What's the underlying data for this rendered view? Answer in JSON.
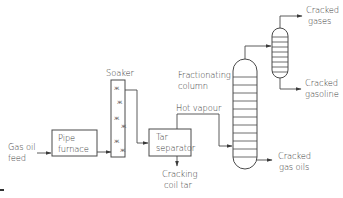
{
  "diagram": {
    "type": "process-flow",
    "labels": {
      "feed_line1": "Gas oil",
      "feed_line2": "feed",
      "furnace_line1": "Pipe",
      "furnace_line2": "furnace",
      "soaker": "Soaker",
      "tar_sep_line1": "Tar",
      "tar_sep_line2": "separator",
      "hot_vapour": "Hot vapour",
      "tar_out_line1": "Cracking",
      "tar_out_line2": "coil tar",
      "frac_line1": "Fractionating",
      "frac_line2": "column",
      "gases_line1": "Cracked",
      "gases_line2": "gases",
      "gasoline_line1": "Cracked",
      "gasoline_line2": "gasoline",
      "gasoils_line1": "Cracked",
      "gasoils_line2": "gas oils"
    },
    "soaker_marks": [
      "x",
      "x",
      "x",
      "x",
      "x",
      "x"
    ],
    "nodes": [
      "Gas oil feed",
      "Pipe furnace",
      "Soaker",
      "Tar separator",
      "Fractionating column",
      "Secondary column"
    ],
    "edges": [
      [
        "Gas oil feed",
        "Pipe furnace"
      ],
      [
        "Pipe furnace",
        "Soaker"
      ],
      [
        "Soaker",
        "Tar separator"
      ],
      [
        "Tar separator",
        "Cracking coil tar"
      ],
      [
        "Tar separator",
        "Fractionating column",
        "Hot vapour"
      ],
      [
        "Fractionating column",
        "Secondary column"
      ],
      [
        "Fractionating column",
        "Cracked gas oils"
      ],
      [
        "Secondary column",
        "Cracked gases"
      ],
      [
        "Secondary column",
        "Cracked gasoline"
      ]
    ]
  }
}
